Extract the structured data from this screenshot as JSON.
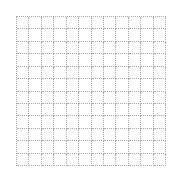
{
  "grid": {
    "rows": 12,
    "columns": 12,
    "line_color": "#a8a8a8",
    "line_style": "dotted",
    "background": "#ffffff"
  }
}
